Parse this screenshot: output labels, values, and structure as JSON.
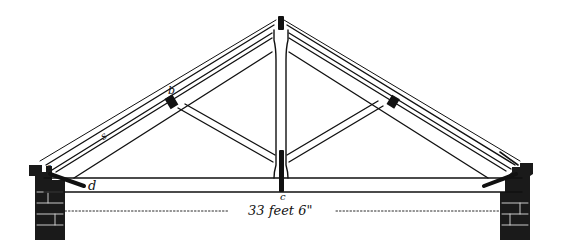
{
  "diagram": {
    "type": "king-post roof truss elevation",
    "labels": {
      "a": "a",
      "b": "b",
      "c": "c",
      "d": "d",
      "small_mark": "s"
    },
    "dimension": {
      "text": "33 feet 6\"",
      "span_label": "33 feet 6\""
    },
    "colors": {
      "ink": "#111111",
      "paper": "#ffffff",
      "brick": "#1a1a1a"
    }
  }
}
